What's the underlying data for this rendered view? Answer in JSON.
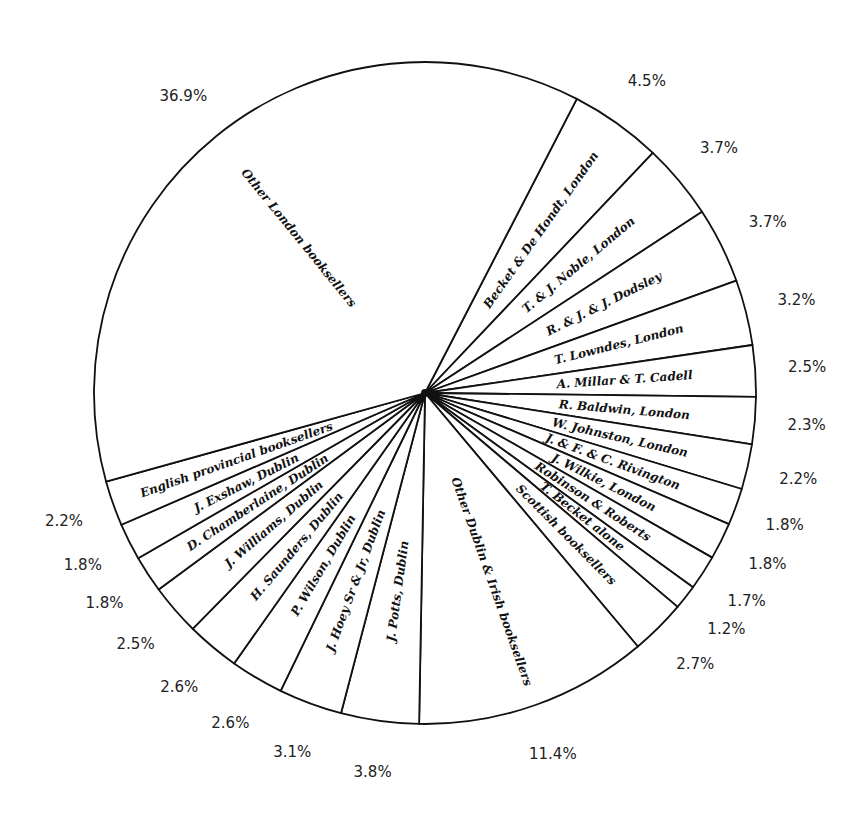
{
  "chart_data": {
    "type": "pie",
    "title": "",
    "legend": "none",
    "direction": "clockwise",
    "start_angle_deg": 27.3,
    "categories": [
      "Becket & De Hondt, London",
      "T. & J. Noble, London",
      "R. & J. & J. Dodsley",
      "T. Lowndes, London",
      "A. Millar & T. Cadell",
      "R. Baldwin, London",
      "W. Johnston, London",
      "J. & F. & C. Rivington",
      "J. Wilkie, London",
      "Robinson & Roberts",
      "T. Becket alone",
      "Scottish booksellers",
      "Other Dublin & Irish booksellers",
      "J. Potts, Dublin",
      "J. Hoey Sr & Jr, Dublin",
      "P. Wilson, Dublin",
      "H. Saunders, Dublin",
      "J. Williams, Dublin",
      "D. Chamberlaine, Dublin",
      "J. Exshaw, Dublin",
      "English provincial booksellers",
      "Other London booksellers"
    ],
    "values": [
      4.5,
      3.7,
      3.7,
      3.2,
      2.5,
      2.3,
      2.2,
      1.8,
      1.8,
      1.7,
      1.2,
      2.7,
      11.4,
      3.8,
      3.1,
      2.6,
      2.6,
      2.5,
      1.8,
      1.8,
      2.2,
      36.9
    ],
    "value_labels": [
      "4.5%",
      "3.7%",
      "3.7%",
      "3.2%",
      "2.5%",
      "2.3%",
      "2.2%",
      "1.8%",
      "1.8%",
      "1.7%",
      "1.2%",
      "2.7%",
      "11.4%",
      "3.8%",
      "3.1%",
      "2.6%",
      "2.6%",
      "2.5%",
      "1.8%",
      "1.8%",
      "2.2%",
      "36.9%"
    ],
    "colors": {
      "stroke": "#111111",
      "fill": "#ffffff",
      "text": "#111111"
    }
  }
}
